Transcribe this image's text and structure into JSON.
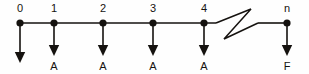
{
  "diagram": {
    "type": "cash-flow-timeline",
    "background_color": "#fefefe",
    "ink_color": "#15120f",
    "width": 309,
    "height": 74,
    "axis": {
      "y": 23,
      "start_x": 20,
      "end_x": 287,
      "break_present": true,
      "break_symbol": "zigzag-break",
      "break_start_x": 216,
      "break_end_x": 258
    },
    "nodes": [
      {
        "id": "period-0",
        "top_label": "0",
        "x": 20,
        "arrow_label": "",
        "arrow_length": "long",
        "arrow_tip_y": 63,
        "has_arrow_label": false
      },
      {
        "id": "period-1",
        "top_label": "1",
        "x": 54,
        "arrow_label": "A",
        "arrow_length": "short",
        "arrow_tip_y": 56,
        "has_arrow_label": true
      },
      {
        "id": "period-2",
        "top_label": "2",
        "x": 103,
        "arrow_label": "A",
        "arrow_length": "short",
        "arrow_tip_y": 56,
        "has_arrow_label": true
      },
      {
        "id": "period-3",
        "top_label": "3",
        "x": 153,
        "arrow_label": "A",
        "arrow_length": "short",
        "arrow_tip_y": 56,
        "has_arrow_label": true
      },
      {
        "id": "period-4",
        "top_label": "4",
        "x": 204,
        "arrow_label": "A",
        "arrow_length": "short",
        "arrow_tip_y": 56,
        "has_arrow_label": true
      },
      {
        "id": "period-n",
        "top_label": "n",
        "x": 287,
        "arrow_label": "F",
        "arrow_length": "short",
        "arrow_tip_y": 56,
        "has_arrow_label": true
      }
    ],
    "label_row_top_y": 12,
    "label_row_bottom_y": 70
  }
}
